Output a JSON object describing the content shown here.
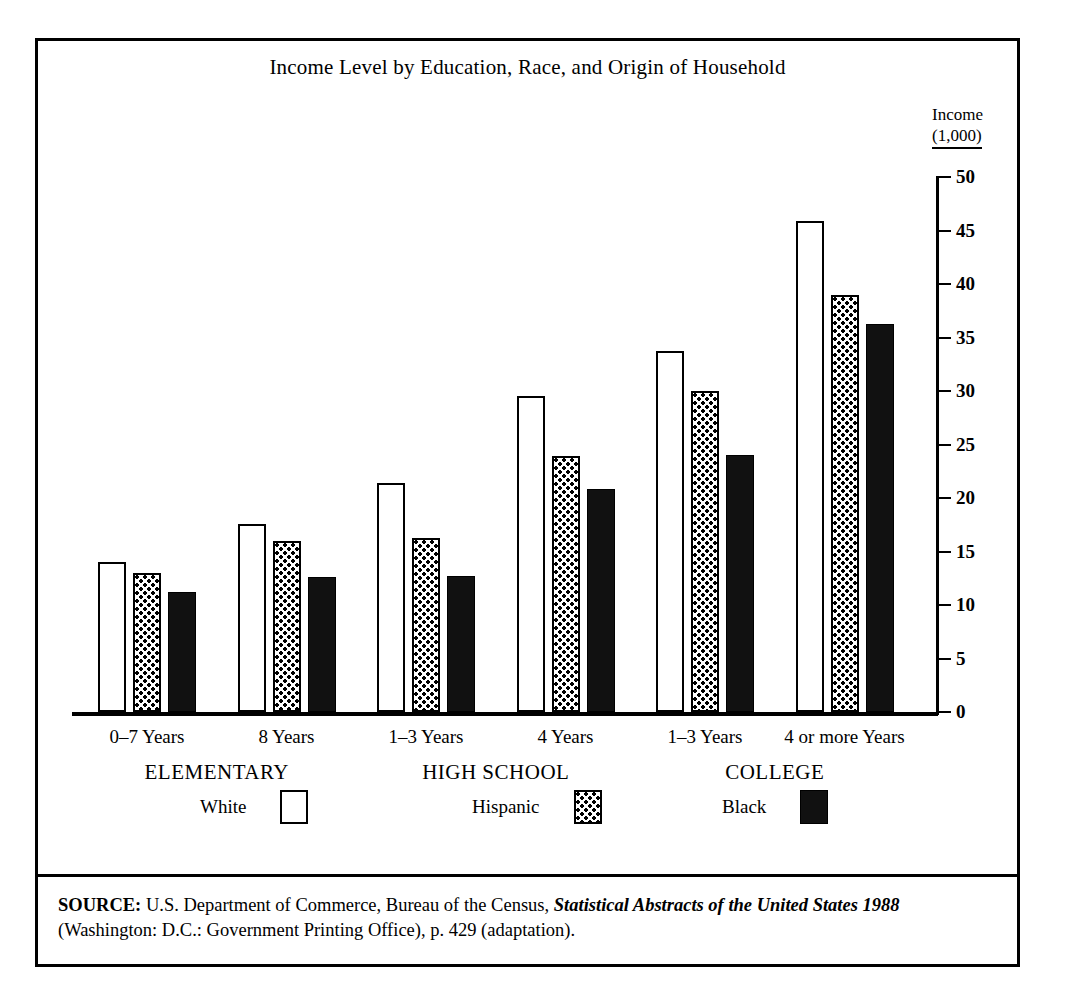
{
  "figure": {
    "title": "Income Level by Education, Race, and Origin of Household",
    "y_caption_line1": "Income",
    "y_caption_line2": "(1,000)",
    "source_prefix": "SOURCE:",
    "source_part1": " U.S. Department of Commerce, Bureau of the Census, ",
    "source_italic": "Statistical Abstracts of the United States",
    "source_year": "1988",
    "source_part2": " (Washington: D.C.: Government Printing Office), p. 429 (adaptation)."
  },
  "legend": {
    "items": [
      {
        "label": "White",
        "swatch": "white"
      },
      {
        "label": "Hispanic",
        "swatch": "hatch"
      },
      {
        "label": "Black",
        "swatch": "black"
      }
    ]
  },
  "chart_data": {
    "type": "bar",
    "title": "Income Level by Education, Race, and Origin of Household",
    "xlabel": "",
    "ylabel": "Income (1,000)",
    "ylim": [
      0,
      50
    ],
    "yticks": [
      0,
      5,
      10,
      15,
      20,
      25,
      30,
      35,
      40,
      45,
      50
    ],
    "grid": false,
    "legend_position": "bottom",
    "categories": [
      "0–7 Years",
      "8 Years",
      "1–3 Years",
      "4 Years",
      "1–3 Years",
      "4 or more Years"
    ],
    "category_groups": [
      {
        "name": "ELEMENTARY",
        "members": [
          "0–7 Years",
          "8 Years"
        ]
      },
      {
        "name": "HIGH SCHOOL",
        "members": [
          "1–3 Years",
          "4 Years"
        ]
      },
      {
        "name": "COLLEGE",
        "members": [
          "1–3 Years",
          "4 or more Years"
        ]
      }
    ],
    "series": [
      {
        "name": "White",
        "fill": "white",
        "values": [
          14.0,
          17.6,
          21.4,
          29.5,
          33.7,
          45.9
        ]
      },
      {
        "name": "Hispanic",
        "fill": "hatch",
        "values": [
          13.0,
          16.0,
          16.3,
          23.9,
          30.0,
          39.0
        ]
      },
      {
        "name": "Black",
        "fill": "black",
        "values": [
          11.2,
          12.6,
          12.7,
          20.8,
          24.0,
          36.3
        ]
      }
    ]
  },
  "colors": {
    "ink": "#000000",
    "paper": "#ffffff",
    "bar_black": "#111111"
  }
}
